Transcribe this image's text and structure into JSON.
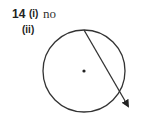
{
  "question": {
    "number": "14",
    "parts": [
      {
        "label": "(i)",
        "answer": "no"
      },
      {
        "label": "(ii)",
        "answer": ""
      }
    ]
  },
  "diagram": {
    "type": "circle-with-line",
    "circle": {
      "cx": 84,
      "cy": 71,
      "r": 41
    },
    "center_dot": true,
    "arrow_line": {
      "x1": 84,
      "y1": 30,
      "x2": 129,
      "y2": 107
    }
  }
}
